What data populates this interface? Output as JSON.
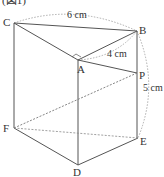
{
  "figure": {
    "caption": "(図1)",
    "vertices": {
      "A": "A",
      "B": "B",
      "C": "C",
      "D": "D",
      "E": "E",
      "F": "F",
      "P": "P"
    },
    "dimensions": {
      "CB": "6 cm",
      "AB": "4 cm",
      "BE": "5 cm"
    }
  }
}
